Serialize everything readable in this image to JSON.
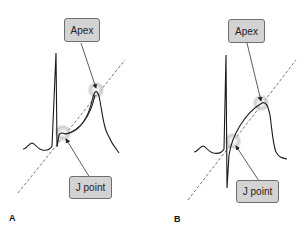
{
  "panels": [
    {
      "id": "A",
      "label": "A",
      "annotations": {
        "apex": "Apex",
        "j_point": "J point"
      }
    },
    {
      "id": "B",
      "label": "B",
      "annotations": {
        "apex": "Apex",
        "j_point": "J point"
      }
    }
  ],
  "colors": {
    "trace": "#1a1a1a",
    "dashed_line": "#777777",
    "box_fill": "#d3d3d3",
    "box_border": "#6e6e6e",
    "highlight_glow": "#9a9a9a"
  }
}
